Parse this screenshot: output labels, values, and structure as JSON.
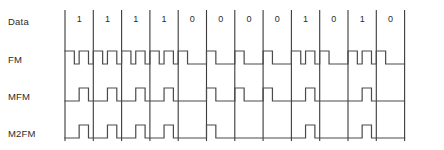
{
  "figure": {
    "type": "timing-diagram",
    "title": "",
    "background_color": "#ffffff",
    "line_color": "#4a4a4a",
    "clock_line_color": "#3a3a3a",
    "text_color": "#2b2b2b"
  },
  "rows": [
    {
      "label": "Data",
      "name": "data"
    },
    {
      "label": "FM",
      "name": "fm"
    },
    {
      "label": "MFM",
      "name": "mfm"
    },
    {
      "label": "M2FM",
      "name": "m2fm"
    }
  ],
  "bits": [
    "1",
    "1",
    "1",
    "1",
    "0",
    "0",
    "0",
    "0",
    "1",
    "0",
    "1",
    "0"
  ],
  "chart_data": {
    "type": "line",
    "title": "",
    "xlabel": "",
    "ylabel": "",
    "categories": [
      "1",
      "1",
      "1",
      "1",
      "0",
      "0",
      "0",
      "0",
      "1",
      "0",
      "1",
      "0"
    ],
    "series": [
      {
        "name": "Data",
        "values": [
          1,
          1,
          1,
          1,
          0,
          0,
          0,
          0,
          1,
          0,
          1,
          0
        ]
      },
      {
        "name": "FM",
        "values": [
          1,
          1,
          1,
          1,
          0,
          0,
          0,
          0,
          1,
          0,
          1,
          0
        ]
      },
      {
        "name": "MFM",
        "values": [
          1,
          1,
          1,
          1,
          0,
          0,
          0,
          0,
          1,
          0,
          1,
          0
        ]
      },
      {
        "name": "M2FM",
        "values": [
          1,
          1,
          1,
          1,
          0,
          0,
          0,
          0,
          1,
          0,
          1,
          0
        ]
      }
    ],
    "grid": false,
    "legend": "left-row-labels"
  },
  "geometry": {
    "cell_width_px": 28.3,
    "first_clock_x_px": 65,
    "clock_count": 13,
    "row_tops_px": [
      10,
      47,
      84,
      121
    ],
    "row_height_px": 30
  }
}
